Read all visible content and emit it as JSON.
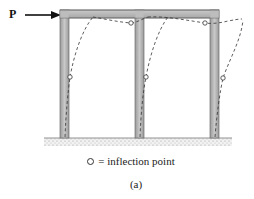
{
  "diagram": {
    "load": {
      "label": "P",
      "direction": "right"
    },
    "legend": {
      "symbol": "open-circle",
      "symbol_char": "o",
      "equals": "=",
      "text": "inflection point",
      "full_text": "= inflection point"
    },
    "caption": "(a)",
    "frame": {
      "type": "two-bay portal frame",
      "columns": 3,
      "bays": 2,
      "member_color": "#b8b8b8",
      "member_edge_color": "#6e6e6e"
    },
    "deflected_shape": {
      "style": "dashed",
      "inflection_points": 6
    }
  }
}
